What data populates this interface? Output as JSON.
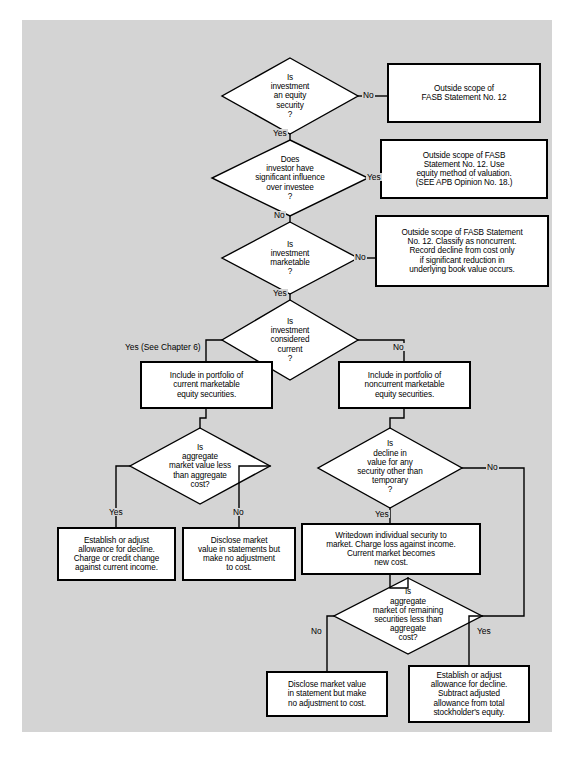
{
  "diagram": {
    "background_color": "#d4d4d4",
    "page_color": "#ffffff",
    "node_fill": "#ffffff",
    "line_color": "#000000"
  },
  "nodes": {
    "d1": {
      "type": "decision",
      "text": "Is\ninvestment\nan equity\nsecurity\n?"
    },
    "b1": {
      "type": "process",
      "text": "Outside scope of\nFASB Statement No. 12"
    },
    "d2": {
      "type": "decision",
      "text": "Does\ninvestor have\nsignificant influence\nover investee\n?"
    },
    "b2": {
      "type": "process",
      "text": "Outside scope of FASB\nStatement No. 12. Use\nequity method of valuation.\n(SEE APB Opinion No. 18.)"
    },
    "d3": {
      "type": "decision",
      "text": "Is\ninvestment\nmarketable\n?"
    },
    "b3": {
      "type": "process",
      "text": "Outside scope of FASB Statement\nNo. 12. Classify as noncurrent.\nRecord decline from cost only\nif significant reduction in\nunderlying book value occurs."
    },
    "d4": {
      "type": "decision",
      "text": "Is\ninvestment\nconsidered\ncurrent\n?"
    },
    "b4": {
      "type": "process",
      "text": "Include in portfolio of\ncurrent marketable\nequity securities."
    },
    "b5": {
      "type": "process",
      "text": "Include in portfolio of\nnoncurrent marketable\nequity securities."
    },
    "d5": {
      "type": "decision",
      "text": "Is\naggregate\nmarket value less\nthan aggregate\ncost?"
    },
    "d6": {
      "type": "decision",
      "text": "Is\ndecline in\nvalue for any\nsecurity other than\ntemporary\n?"
    },
    "b6": {
      "type": "process",
      "text": "Establish or adjust\nallowance for decline.\nCharge or credit change\nagainst current income."
    },
    "b7": {
      "type": "process",
      "text": "Disclose market\nvalue in statements but\nmake no adjustment\nto cost."
    },
    "b8": {
      "type": "process",
      "text": "Writedown individual security to\nmarket. Charge loss against income.\nCurrent market becomes\nnew cost."
    },
    "d7": {
      "type": "decision",
      "text": "Is\naggregate\nmarket of remaining\nsecurities less than\naggregate\ncost?"
    },
    "b9": {
      "type": "process",
      "text": "Disclose market value\nin statement but make\nno adjustment to cost."
    },
    "b10": {
      "type": "process",
      "text": "Establish or adjust\nallowance for decline.\nSubtract adjusted\nallowance from total\nstockholder's equity."
    }
  },
  "edge_labels": {
    "e1_no": "No",
    "e1_yes": "Yes",
    "e2_yes": "Yes",
    "e2_no": "No",
    "e3_no": "No",
    "e3_yes": "Yes",
    "e4_yes": "Yes (See Chapter 6)",
    "e4_no": "No",
    "e5_yes": "Yes",
    "e5_no": "No",
    "e6_no": "No",
    "e6_yes": "Yes",
    "e7_no": "No",
    "e7_yes": "Yes"
  }
}
